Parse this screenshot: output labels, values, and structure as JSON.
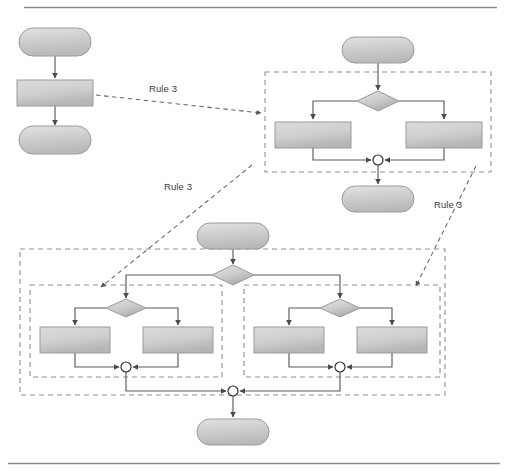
{
  "figure": {
    "rule_labels": [
      {
        "id": "rule-label-1",
        "text": "Rule 3",
        "x": 163,
        "y": 92
      },
      {
        "id": "rule-label-2",
        "text": "Rule 3",
        "x": 178,
        "y": 190
      },
      {
        "id": "rule-label-3",
        "text": "Rule 3",
        "x": 448,
        "y": 208
      }
    ],
    "colors": {
      "node_fill_light": "#d6d6d6",
      "node_fill_dark": "#bdbdbd",
      "node_stroke": "#9a9a9a",
      "edge_stroke": "#555555",
      "dashed_box_stroke": "#8f8f8f",
      "rule_arrow_stroke": "#666666",
      "rule_text": "#3a3a3a",
      "separator_rule": "#8a8a90",
      "merge_fill": "#ffffff",
      "merge_stroke": "#333333"
    },
    "separators": [
      {
        "id": "top-rule",
        "y": 7
      },
      {
        "id": "bottom-rule",
        "y": 463
      }
    ],
    "groups": [
      {
        "id": "group-top-right",
        "label": "",
        "x": 265,
        "y": 72,
        "w": 226,
        "h": 100,
        "style": "dashed"
      },
      {
        "id": "group-bottom-outer",
        "label": "",
        "x": 20,
        "y": 249,
        "w": 425,
        "h": 146,
        "style": "dashed"
      },
      {
        "id": "group-bottom-left-inner",
        "label": "",
        "x": 30,
        "y": 285,
        "w": 192,
        "h": 92,
        "style": "dashed"
      },
      {
        "id": "group-bottom-right-inner",
        "label": "",
        "x": 244,
        "y": 285,
        "w": 196,
        "h": 92,
        "style": "dashed"
      }
    ],
    "nodes": [
      {
        "id": "n-start-1",
        "kind": "rounded",
        "label": "",
        "cx": 55,
        "cy": 42,
        "w": 72,
        "h": 28
      },
      {
        "id": "n-task-1",
        "kind": "rect",
        "label": "",
        "cx": 55,
        "cy": 93,
        "w": 76,
        "h": 26
      },
      {
        "id": "n-end-1",
        "kind": "rounded",
        "label": "",
        "cx": 55,
        "cy": 140,
        "w": 72,
        "h": 28
      },
      {
        "id": "n-start-2",
        "kind": "rounded",
        "label": "",
        "cx": 378,
        "cy": 50,
        "w": 72,
        "h": 26
      },
      {
        "id": "n-dec-2",
        "kind": "diamond",
        "label": "",
        "cx": 378,
        "cy": 101,
        "w": 42,
        "h": 20
      },
      {
        "id": "n-task-2a",
        "kind": "rect",
        "label": "",
        "cx": 313,
        "cy": 135,
        "w": 76,
        "h": 26
      },
      {
        "id": "n-task-2b",
        "kind": "rect",
        "label": "",
        "cx": 444,
        "cy": 135,
        "w": 76,
        "h": 26
      },
      {
        "id": "n-merge-2",
        "kind": "merge",
        "label": "",
        "cx": 378,
        "cy": 160,
        "r": 5
      },
      {
        "id": "n-end-2",
        "kind": "rounded",
        "label": "",
        "cx": 378,
        "cy": 199,
        "w": 72,
        "h": 26
      },
      {
        "id": "n-start-3",
        "kind": "rounded",
        "label": "",
        "cx": 233,
        "cy": 236,
        "w": 72,
        "h": 26
      },
      {
        "id": "n-dec-3",
        "kind": "diamond",
        "label": "",
        "cx": 233,
        "cy": 275,
        "w": 42,
        "h": 20
      },
      {
        "id": "n-dec-3L",
        "kind": "diamond",
        "label": "",
        "cx": 126,
        "cy": 308,
        "w": 40,
        "h": 19
      },
      {
        "id": "n-task-3La",
        "kind": "rect",
        "label": "",
        "cx": 75,
        "cy": 340,
        "w": 70,
        "h": 26
      },
      {
        "id": "n-task-3Lb",
        "kind": "rect",
        "label": "",
        "cx": 178,
        "cy": 340,
        "w": 70,
        "h": 26
      },
      {
        "id": "n-merge-3L",
        "kind": "merge",
        "label": "",
        "cx": 126,
        "cy": 367,
        "r": 5
      },
      {
        "id": "n-dec-3R",
        "kind": "diamond",
        "label": "",
        "cx": 340,
        "cy": 308,
        "w": 40,
        "h": 19
      },
      {
        "id": "n-task-3Ra",
        "kind": "rect",
        "label": "",
        "cx": 289,
        "cy": 340,
        "w": 70,
        "h": 26
      },
      {
        "id": "n-task-3Rb",
        "kind": "rect",
        "label": "",
        "cx": 392,
        "cy": 340,
        "w": 70,
        "h": 26
      },
      {
        "id": "n-merge-3R",
        "kind": "merge",
        "label": "",
        "cx": 340,
        "cy": 367,
        "r": 5
      },
      {
        "id": "n-merge-3",
        "kind": "merge",
        "label": "",
        "cx": 233,
        "cy": 391,
        "r": 5
      },
      {
        "id": "n-end-3",
        "kind": "rounded",
        "label": "",
        "cx": 233,
        "cy": 432,
        "w": 72,
        "h": 26
      }
    ],
    "edges": [
      {
        "id": "e-1",
        "from": "n-start-1",
        "to": "n-task-1",
        "type": "solid-arrow"
      },
      {
        "id": "e-2",
        "from": "n-task-1",
        "to": "n-end-1",
        "type": "solid-arrow"
      },
      {
        "id": "e-3",
        "from": "n-start-2",
        "to": "n-dec-2",
        "type": "solid-arrow"
      },
      {
        "id": "e-4",
        "from": "n-dec-2",
        "to": "n-task-2a",
        "type": "solid-arrow"
      },
      {
        "id": "e-5",
        "from": "n-dec-2",
        "to": "n-task-2b",
        "type": "solid-arrow"
      },
      {
        "id": "e-6",
        "from": "n-task-2a",
        "to": "n-merge-2",
        "type": "solid-arrow"
      },
      {
        "id": "e-7",
        "from": "n-task-2b",
        "to": "n-merge-2",
        "type": "solid-arrow"
      },
      {
        "id": "e-8",
        "from": "n-merge-2",
        "to": "n-end-2",
        "type": "solid-arrow"
      },
      {
        "id": "e-9",
        "from": "n-start-3",
        "to": "n-dec-3",
        "type": "solid-arrow"
      },
      {
        "id": "e-10",
        "from": "n-dec-3",
        "to": "n-dec-3L",
        "type": "solid-arrow"
      },
      {
        "id": "e-11",
        "from": "n-dec-3",
        "to": "n-dec-3R",
        "type": "solid-arrow"
      },
      {
        "id": "e-12",
        "from": "n-dec-3L",
        "to": "n-task-3La",
        "type": "solid-arrow"
      },
      {
        "id": "e-13",
        "from": "n-dec-3L",
        "to": "n-task-3Lb",
        "type": "solid-arrow"
      },
      {
        "id": "e-14",
        "from": "n-task-3La",
        "to": "n-merge-3L",
        "type": "solid-arrow"
      },
      {
        "id": "e-15",
        "from": "n-task-3Lb",
        "to": "n-merge-3L",
        "type": "solid-arrow"
      },
      {
        "id": "e-16",
        "from": "n-dec-3R",
        "to": "n-task-3Ra",
        "type": "solid-arrow"
      },
      {
        "id": "e-17",
        "from": "n-dec-3R",
        "to": "n-task-3Rb",
        "type": "solid-arrow"
      },
      {
        "id": "e-18",
        "from": "n-task-3Ra",
        "to": "n-merge-3R",
        "type": "solid-arrow"
      },
      {
        "id": "e-19",
        "from": "n-task-3Rb",
        "to": "n-merge-3R",
        "type": "solid-arrow"
      },
      {
        "id": "e-20",
        "from": "n-merge-3L",
        "to": "n-merge-3",
        "type": "solid-arrow"
      },
      {
        "id": "e-21",
        "from": "n-merge-3R",
        "to": "n-merge-3",
        "type": "solid-arrow"
      },
      {
        "id": "e-22",
        "from": "n-merge-3",
        "to": "n-end-3",
        "type": "solid-arrow"
      }
    ],
    "rule_arrows": [
      {
        "id": "rule-arrow-1",
        "label_ref": "rule-label-1",
        "from": [
          96,
          95
        ],
        "to": [
          263,
          113
        ]
      },
      {
        "id": "rule-arrow-2",
        "label_ref": "rule-label-2",
        "from": [
          252,
          165
        ],
        "to": [
          100,
          288
        ]
      },
      {
        "id": "rule-arrow-3",
        "label_ref": "rule-label-3",
        "from": [
          475,
          165
        ],
        "to": [
          415,
          287
        ]
      }
    ]
  }
}
